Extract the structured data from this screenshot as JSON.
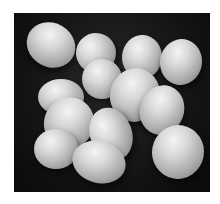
{
  "image": {
    "subject": "Pile of white eggs on a dark background",
    "style": "black-and-white photograph",
    "colors": {
      "background": "#ffffff",
      "backdrop": "#141414",
      "egg_highlight": "#f4f4f4",
      "egg_shadow": "#6e6e6e"
    },
    "eggs": [
      {
        "x": 12,
        "y": 10,
        "w": 50,
        "h": 44,
        "rot": 30
      },
      {
        "x": 62,
        "y": 20,
        "w": 40,
        "h": 40,
        "rot": -10
      },
      {
        "x": 108,
        "y": 22,
        "w": 40,
        "h": 44,
        "rot": 5
      },
      {
        "x": 146,
        "y": 26,
        "w": 42,
        "h": 46,
        "rot": 10
      },
      {
        "x": 68,
        "y": 46,
        "w": 40,
        "h": 40,
        "rot": 0
      },
      {
        "x": 24,
        "y": 66,
        "w": 46,
        "h": 36,
        "rot": 0
      },
      {
        "x": 96,
        "y": 55,
        "w": 50,
        "h": 54,
        "rot": 15
      },
      {
        "x": 126,
        "y": 72,
        "w": 44,
        "h": 50,
        "rot": 20
      },
      {
        "x": 30,
        "y": 84,
        "w": 50,
        "h": 52,
        "rot": 25
      },
      {
        "x": 76,
        "y": 94,
        "w": 42,
        "h": 54,
        "rot": -20
      },
      {
        "x": 20,
        "y": 116,
        "w": 44,
        "h": 40,
        "rot": 0
      },
      {
        "x": 58,
        "y": 128,
        "w": 54,
        "h": 42,
        "rot": 15
      },
      {
        "x": 138,
        "y": 112,
        "w": 52,
        "h": 54,
        "rot": 10
      }
    ]
  }
}
